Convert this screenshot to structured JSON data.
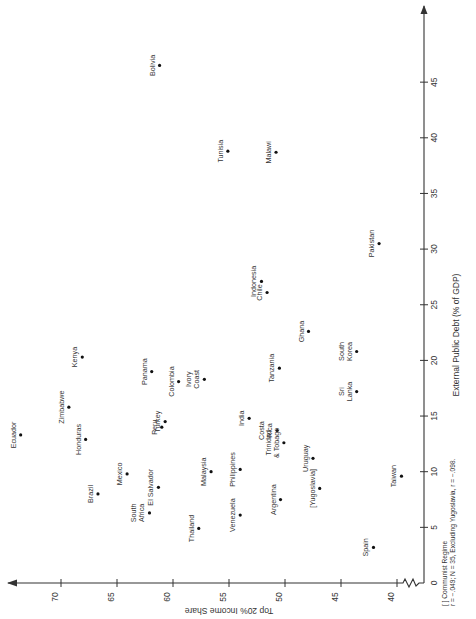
{
  "chart_data": {
    "type": "scatter",
    "title": "",
    "orientation_note": "figure printed rotated 90 degrees clockwise",
    "xlabel": "External Public Debt (% of GDP)",
    "ylabel": "Top 20% Income Share",
    "xlim": [
      0,
      48
    ],
    "ylim": [
      40,
      74
    ],
    "x_ticks": [
      5,
      10,
      15,
      20,
      25,
      30,
      35,
      40,
      45
    ],
    "y_ticks": [
      40,
      45,
      50,
      55,
      60,
      65,
      70
    ],
    "x_axis_origin_label": "0",
    "y_axis_break": true,
    "grid": false,
    "legend": null,
    "points": [
      {
        "label": "Bolivia",
        "x": 46.5,
        "y": 61.2
      },
      {
        "label": "Tunisia",
        "x": 38.8,
        "y": 55.1
      },
      {
        "label": "Malawi",
        "x": 38.7,
        "y": 50.8
      },
      {
        "label": "Pakistan",
        "x": 30.5,
        "y": 41.6
      },
      {
        "label": "Indonesia",
        "x": 27.1,
        "y": 52.1
      },
      {
        "label": "Chile",
        "x": 26.1,
        "y": 51.6
      },
      {
        "label": "Ghana",
        "x": 22.6,
        "y": 47.9
      },
      {
        "label": "South Korea",
        "x": 20.8,
        "y": 43.6
      },
      {
        "label": "Kenya",
        "x": 20.3,
        "y": 68.1
      },
      {
        "label": "Panama",
        "x": 19.0,
        "y": 61.9
      },
      {
        "label": "Tanzania",
        "x": 19.3,
        "y": 50.5
      },
      {
        "label": "Ivory Coast",
        "x": 18.3,
        "y": 57.2
      },
      {
        "label": "Colombia",
        "x": 18.1,
        "y": 59.5
      },
      {
        "label": "Zimbabwe",
        "x": 15.8,
        "y": 69.3
      },
      {
        "label": "Sri Lanka",
        "x": 17.2,
        "y": 43.6
      },
      {
        "label": "India",
        "x": 14.8,
        "y": 53.2
      },
      {
        "label": "Turkey",
        "x": 14.5,
        "y": 60.7
      },
      {
        "label": "Peru",
        "x": 14.0,
        "y": 61.0
      },
      {
        "label": "Costa Rica",
        "x": 13.7,
        "y": 50.7
      },
      {
        "label": "Ecuador",
        "x": 13.3,
        "y": 73.6
      },
      {
        "label": "Honduras",
        "x": 12.9,
        "y": 67.8
      },
      {
        "label": "Trinidad & Tobago",
        "x": 12.6,
        "y": 50.1
      },
      {
        "label": "Uruguay",
        "x": 11.2,
        "y": 47.5
      },
      {
        "label": "Mexico",
        "x": 9.8,
        "y": 64.1
      },
      {
        "label": "Malaysia",
        "x": 10.0,
        "y": 56.6
      },
      {
        "label": "Philippines",
        "x": 10.2,
        "y": 54.0
      },
      {
        "label": "Taiwan",
        "x": 9.6,
        "y": 39.6
      },
      {
        "label": "El Salvador",
        "x": 8.6,
        "y": 61.3
      },
      {
        "label": "[Yugoslavia]",
        "x": 8.5,
        "y": 46.9
      },
      {
        "label": "Brazil",
        "x": 8.0,
        "y": 66.7
      },
      {
        "label": "Argentina",
        "x": 7.5,
        "y": 50.4
      },
      {
        "label": "South Africa",
        "x": 6.3,
        "y": 62.1
      },
      {
        "label": "Venezuela",
        "x": 6.1,
        "y": 54.0
      },
      {
        "label": "Thailand",
        "x": 4.9,
        "y": 57.7
      },
      {
        "label": "Spain",
        "x": 3.2,
        "y": 42.1
      }
    ],
    "annotations": [
      "[ ] Communist Regime",
      "r = -.049; N = 35, Excluding Yugoslavia, r = -.098."
    ]
  },
  "labels": {
    "xlabel": "External Public Debt (% of GDP)",
    "ylabel": "Top 20% Income Share",
    "note1": "[ ] Communist Regime",
    "note2": "r = −.049; N = 35, Excluding Yugoslavia, r = −.098.",
    "origin": "0"
  }
}
